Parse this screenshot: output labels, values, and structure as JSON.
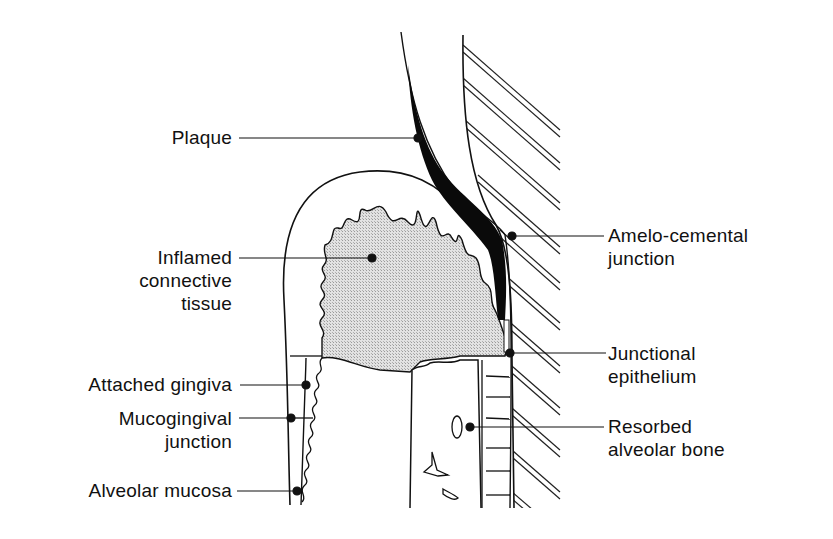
{
  "diagram": {
    "colors": {
      "ink": "#111111",
      "background": "#ffffff",
      "inflamed_fill": "#d4d4d4",
      "plaque_fill": "#0a0a0a"
    },
    "labels_left": [
      {
        "id": "plaque",
        "lines": [
          "Plaque"
        ]
      },
      {
        "id": "inflamed-connective-tissue",
        "lines": [
          "Inflamed",
          "connective",
          "tissue"
        ]
      },
      {
        "id": "attached-gingiva",
        "lines": [
          "Attached gingiva"
        ]
      },
      {
        "id": "mucogingival-junction",
        "lines": [
          "Mucogingival",
          "junction"
        ]
      },
      {
        "id": "alveolar-mucosa",
        "lines": [
          "Alveolar mucosa"
        ]
      }
    ],
    "labels_right": [
      {
        "id": "amelo-cemental-junction",
        "lines": [
          "Amelo-cemental",
          "junction"
        ]
      },
      {
        "id": "junctional-epithelium",
        "lines": [
          "Junctional",
          "epithelium"
        ]
      },
      {
        "id": "resorbed-alveolar-bone",
        "lines": [
          "Resorbed",
          "alveolar bone"
        ]
      }
    ]
  }
}
